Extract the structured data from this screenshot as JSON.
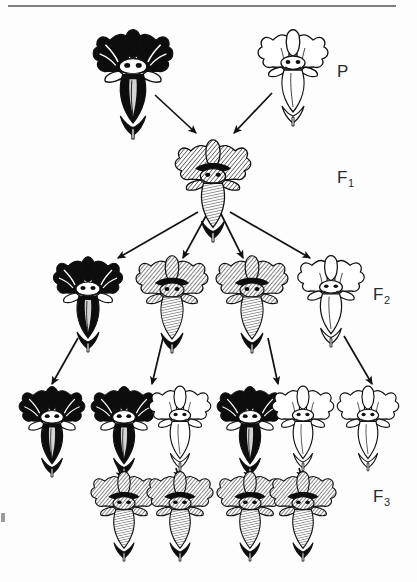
{
  "figure": {
    "background_color": "#fdfdfd",
    "ink_color": "#111111",
    "top_rule": {
      "present": true,
      "x1": 8,
      "x2": 396,
      "y": 6,
      "color": "#555555"
    }
  },
  "labels": [
    {
      "id": "P",
      "text": "P",
      "subscript": "",
      "name": "generation-label-p"
    },
    {
      "id": "F1",
      "text": "F",
      "subscript": "1",
      "name": "generation-label-f1"
    },
    {
      "id": "F2",
      "text": "F",
      "subscript": "2",
      "name": "generation-label-f2"
    },
    {
      "id": "F3",
      "text": "F",
      "subscript": "3",
      "name": "generation-label-f3"
    }
  ],
  "generations": [
    {
      "id": "P",
      "label": "P",
      "row_y": 70,
      "flowers": [
        {
          "x": 133,
          "y": 70,
          "phenotype": "dark",
          "scale": 1.15,
          "name": "flower-p-dark"
        },
        {
          "x": 293,
          "y": 66,
          "phenotype": "white",
          "scale": 1.0,
          "name": "flower-p-white"
        }
      ]
    },
    {
      "id": "F1",
      "label": "F1",
      "row_y": 178,
      "flowers": [
        {
          "x": 213,
          "y": 178,
          "phenotype": "intermediate",
          "scale": 1.05,
          "name": "flower-f1-intermediate"
        }
      ]
    },
    {
      "id": "F2",
      "label": "F2",
      "row_y": 290,
      "flowers": [
        {
          "x": 88,
          "y": 292,
          "phenotype": "dark",
          "scale": 1.0,
          "name": "flower-f2-dark"
        },
        {
          "x": 172,
          "y": 292,
          "phenotype": "intermediate",
          "scale": 1.0,
          "name": "flower-f2-intermediate-1"
        },
        {
          "x": 252,
          "y": 292,
          "phenotype": "intermediate",
          "scale": 1.0,
          "name": "flower-f2-intermediate-2"
        },
        {
          "x": 331,
          "y": 290,
          "phenotype": "white",
          "scale": 0.95,
          "name": "flower-f2-white"
        }
      ]
    },
    {
      "id": "F3",
      "label": "F3",
      "row_y": 420,
      "flowers": [
        {
          "x": 52,
          "y": 420,
          "phenotype": "dark",
          "scale": 0.95,
          "name": "flower-f3-dark-1"
        },
        {
          "x": 124,
          "y": 420,
          "phenotype": "dark",
          "scale": 0.95,
          "name": "flower-f3-dark-2"
        },
        {
          "x": 180,
          "y": 418,
          "phenotype": "white",
          "scale": 0.88,
          "name": "flower-f3-white-1"
        },
        {
          "x": 250,
          "y": 420,
          "phenotype": "dark",
          "scale": 0.95,
          "name": "flower-f3-dark-3"
        },
        {
          "x": 303,
          "y": 418,
          "phenotype": "white",
          "scale": 0.88,
          "name": "flower-f3-white-2"
        },
        {
          "x": 368,
          "y": 418,
          "phenotype": "white",
          "scale": 0.88,
          "name": "flower-f3-white-3"
        },
        {
          "x": 124,
          "y": 505,
          "phenotype": "intermediate",
          "scale": 0.92,
          "name": "flower-f3-intermediate-1"
        },
        {
          "x": 180,
          "y": 505,
          "phenotype": "intermediate",
          "scale": 0.92,
          "name": "flower-f3-intermediate-2"
        },
        {
          "x": 250,
          "y": 505,
          "phenotype": "intermediate",
          "scale": 0.92,
          "name": "flower-f3-intermediate-3"
        },
        {
          "x": 303,
          "y": 505,
          "phenotype": "intermediate",
          "scale": 0.92,
          "name": "flower-f3-intermediate-4"
        }
      ]
    }
  ],
  "arrows": [
    {
      "x1": 155,
      "y1": 95,
      "x2": 196,
      "y2": 133,
      "name": "arrow-p-dark-to-f1"
    },
    {
      "x1": 272,
      "y1": 93,
      "x2": 234,
      "y2": 133,
      "name": "arrow-p-white-to-f1"
    },
    {
      "x1": 198,
      "y1": 212,
      "x2": 118,
      "y2": 258,
      "name": "arrow-f1-to-f2-1"
    },
    {
      "x1": 207,
      "y1": 214,
      "x2": 183,
      "y2": 258,
      "name": "arrow-f1-to-f2-2"
    },
    {
      "x1": 221,
      "y1": 214,
      "x2": 243,
      "y2": 258,
      "name": "arrow-f1-to-f2-3"
    },
    {
      "x1": 230,
      "y1": 212,
      "x2": 310,
      "y2": 258,
      "name": "arrow-f1-to-f2-4"
    },
    {
      "x1": 78,
      "y1": 338,
      "x2": 52,
      "y2": 384,
      "name": "arrow-f2-1-to-f3"
    },
    {
      "x1": 163,
      "y1": 338,
      "x2": 152,
      "y2": 384,
      "name": "arrow-f2-2-to-f3"
    },
    {
      "x1": 268,
      "y1": 338,
      "x2": 278,
      "y2": 384,
      "name": "arrow-f2-3-to-f3"
    },
    {
      "x1": 344,
      "y1": 336,
      "x2": 372,
      "y2": 384,
      "name": "arrow-f2-4-to-f3"
    },
    {
      "x1": 118,
      "y1": 468,
      "x2": 122,
      "y2": 478,
      "name": "arrow-f3-stem-1"
    },
    {
      "x1": 176,
      "y1": 468,
      "x2": 179,
      "y2": 478,
      "name": "arrow-f3-stem-2"
    },
    {
      "x1": 246,
      "y1": 468,
      "x2": 249,
      "y2": 478,
      "name": "arrow-f3-stem-3"
    },
    {
      "x1": 299,
      "y1": 468,
      "x2": 302,
      "y2": 478,
      "name": "arrow-f3-stem-4"
    }
  ],
  "phenotype_colors": {
    "dark": "#0d0d0d",
    "intermediate": "#8d8d8d",
    "white": "#ffffff",
    "outline": "#111111"
  }
}
